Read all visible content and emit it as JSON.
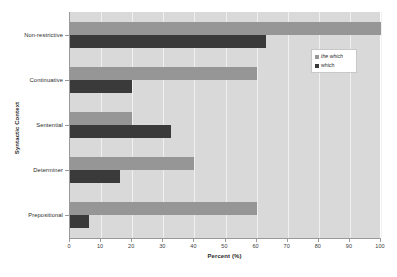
{
  "chart_data": {
    "type": "bar",
    "orientation": "horizontal",
    "title": "",
    "xlabel": "Percent (%)",
    "ylabel": "Syntactic Context",
    "categories": [
      "Non-restrictive",
      "Continuative",
      "Sentential",
      "Determiner",
      "Prepositional"
    ],
    "series": [
      {
        "name": "the which",
        "color": "#969696",
        "values": [
          100,
          60,
          20,
          40,
          60
        ]
      },
      {
        "name": "which",
        "color": "#3a3a3a",
        "values": [
          63,
          20,
          32.5,
          16,
          6
        ]
      }
    ],
    "xlim": [
      0,
      100
    ],
    "xticks": [
      0,
      10,
      20,
      30,
      40,
      50,
      60,
      70,
      80,
      90,
      100
    ],
    "xtick_labels": [
      "0",
      "10",
      "20",
      "30",
      "40",
      "50",
      "60",
      "70",
      "80",
      "90",
      "100"
    ],
    "grid": true,
    "grid_axis": "x",
    "legend_position": "upper right",
    "plot_background": "#d9d9d9",
    "figure_background": "#ffffff",
    "gridline_color": "#f0f0f0"
  },
  "legend": {
    "entries": [
      {
        "label": "the which",
        "swatch_color": "#969696",
        "italic": true
      },
      {
        "label": "which",
        "swatch_color": "#3a3a3a",
        "italic": false
      }
    ]
  },
  "axes": {
    "x_title": "Percent (%)",
    "y_title": "Syntactic Context"
  }
}
